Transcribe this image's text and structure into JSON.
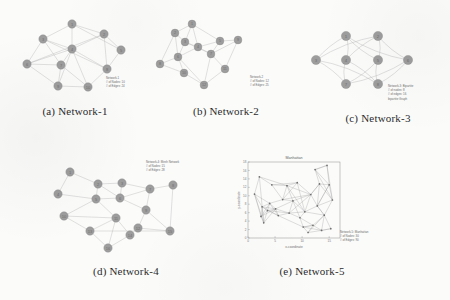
{
  "figure": {
    "panels": [
      {
        "key": "a",
        "caption": "(a) Network-1",
        "annotation": [
          "Network-1",
          "# of Nodes: 10",
          "# of Edges: 24"
        ],
        "node_label_prefix": "n",
        "nodes": [
          {
            "id": "1",
            "x": 72,
            "y": 22
          },
          {
            "id": "2",
            "x": 104,
            "y": 32
          },
          {
            "id": "3",
            "x": 43,
            "y": 37
          },
          {
            "id": "4",
            "x": 72,
            "y": 47
          },
          {
            "id": "5",
            "x": 121,
            "y": 48
          },
          {
            "id": "6",
            "x": 27,
            "y": 62
          },
          {
            "id": "7",
            "x": 61,
            "y": 63
          },
          {
            "id": "8",
            "x": 107,
            "y": 67
          },
          {
            "id": "9",
            "x": 58,
            "y": 84
          },
          {
            "id": "10",
            "x": 88,
            "y": 85
          }
        ],
        "edges": [
          [
            0,
            1
          ],
          [
            0,
            2
          ],
          [
            0,
            3
          ],
          [
            0,
            4
          ],
          [
            1,
            3
          ],
          [
            1,
            4
          ],
          [
            1,
            7
          ],
          [
            2,
            3
          ],
          [
            2,
            5
          ],
          [
            2,
            6
          ],
          [
            3,
            5
          ],
          [
            3,
            6
          ],
          [
            3,
            7
          ],
          [
            3,
            8
          ],
          [
            3,
            9
          ],
          [
            4,
            7
          ],
          [
            5,
            6
          ],
          [
            5,
            8
          ],
          [
            6,
            8
          ],
          [
            6,
            9
          ],
          [
            7,
            9
          ],
          [
            8,
            9
          ],
          [
            2,
            7
          ],
          [
            1,
            5
          ]
        ]
      },
      {
        "key": "b",
        "caption": "(b) Network-2",
        "annotation": [
          "Network-2",
          "# of Nodes: 12",
          "# of Edges: 25"
        ],
        "nodes": [
          {
            "id": "1",
            "x": 40,
            "y": 22
          },
          {
            "id": "2",
            "x": 23,
            "y": 31
          },
          {
            "id": "3",
            "x": 33,
            "y": 40
          },
          {
            "id": "4",
            "x": 46,
            "y": 45
          },
          {
            "id": "5",
            "x": 68,
            "y": 39
          },
          {
            "id": "6",
            "x": 26,
            "y": 55
          },
          {
            "id": "7",
            "x": 59,
            "y": 52
          },
          {
            "id": "8",
            "x": 8,
            "y": 62
          },
          {
            "id": "9",
            "x": 86,
            "y": 38
          },
          {
            "id": "10",
            "x": 32,
            "y": 71
          },
          {
            "id": "11",
            "x": 73,
            "y": 67
          },
          {
            "id": "12",
            "x": 52,
            "y": 83
          }
        ],
        "edges": [
          [
            0,
            2
          ],
          [
            0,
            3
          ],
          [
            0,
            1
          ],
          [
            1,
            2
          ],
          [
            1,
            5
          ],
          [
            2,
            3
          ],
          [
            2,
            5
          ],
          [
            3,
            4
          ],
          [
            3,
            6
          ],
          [
            4,
            6
          ],
          [
            4,
            8
          ],
          [
            5,
            7
          ],
          [
            5,
            9
          ],
          [
            6,
            10
          ],
          [
            6,
            11
          ],
          [
            7,
            9
          ],
          [
            8,
            10
          ],
          [
            9,
            11
          ],
          [
            10,
            11
          ],
          [
            2,
            6
          ],
          [
            3,
            5
          ],
          [
            5,
            11
          ],
          [
            0,
            4
          ],
          [
            6,
            8
          ],
          [
            1,
            7
          ]
        ]
      },
      {
        "key": "c",
        "caption": "(c) Network-3",
        "annotation": [
          "Network-3: Bipartite",
          "# of nodes: 8",
          "# of edges: 16",
          "bipartite Graph"
        ],
        "nodes": [
          {
            "id": "1",
            "x": 40,
            "y": 20
          },
          {
            "id": "2",
            "x": 72,
            "y": 20
          },
          {
            "id": "3",
            "x": 10,
            "y": 44
          },
          {
            "id": "4",
            "x": 40,
            "y": 44
          },
          {
            "id": "5",
            "x": 72,
            "y": 44
          },
          {
            "id": "6",
            "x": 102,
            "y": 44
          },
          {
            "id": "7",
            "x": 40,
            "y": 68
          },
          {
            "id": "8",
            "x": 72,
            "y": 68
          }
        ],
        "edges": [
          [
            0,
            2
          ],
          [
            0,
            3
          ],
          [
            0,
            4
          ],
          [
            0,
            5
          ],
          [
            1,
            2
          ],
          [
            1,
            3
          ],
          [
            1,
            4
          ],
          [
            1,
            5
          ],
          [
            6,
            2
          ],
          [
            6,
            3
          ],
          [
            6,
            4
          ],
          [
            6,
            5
          ],
          [
            7,
            2
          ],
          [
            7,
            3
          ],
          [
            7,
            4
          ],
          [
            7,
            5
          ]
        ],
        "curved": true
      },
      {
        "key": "d",
        "caption": "(d) Network-4",
        "annotation": [
          "Network-4: Mesh Network",
          "# of Nodes: 15",
          "# of Edges: 28"
        ],
        "nodes": [
          {
            "id": "1",
            "x": 24,
            "y": 14
          },
          {
            "id": "2",
            "x": 52,
            "y": 26
          },
          {
            "id": "3",
            "x": 76,
            "y": 25
          },
          {
            "id": "4",
            "x": 12,
            "y": 36
          },
          {
            "id": "5",
            "x": 50,
            "y": 41
          },
          {
            "id": "6",
            "x": 74,
            "y": 40
          },
          {
            "id": "7",
            "x": 104,
            "y": 31
          },
          {
            "id": "8",
            "x": 127,
            "y": 27
          },
          {
            "id": "9",
            "x": 100,
            "y": 52
          },
          {
            "id": "10",
            "x": 18,
            "y": 58
          },
          {
            "id": "11",
            "x": 70,
            "y": 60
          },
          {
            "id": "12",
            "x": 92,
            "y": 70
          },
          {
            "id": "13",
            "x": 44,
            "y": 73
          },
          {
            "id": "14",
            "x": 84,
            "y": 77
          },
          {
            "id": "15",
            "x": 124,
            "y": 73
          },
          {
            "id": "16",
            "x": 62,
            "y": 90
          }
        ],
        "edges": [
          [
            0,
            1
          ],
          [
            0,
            3
          ],
          [
            1,
            2
          ],
          [
            1,
            4
          ],
          [
            2,
            5
          ],
          [
            3,
            4
          ],
          [
            4,
            5
          ],
          [
            4,
            10
          ],
          [
            5,
            8
          ],
          [
            5,
            6
          ],
          [
            6,
            7
          ],
          [
            6,
            8
          ],
          [
            8,
            11
          ],
          [
            9,
            10
          ],
          [
            9,
            12
          ],
          [
            10,
            12
          ],
          [
            10,
            13
          ],
          [
            11,
            13
          ],
          [
            11,
            14
          ],
          [
            12,
            15
          ],
          [
            13,
            15
          ],
          [
            10,
            15
          ],
          [
            2,
            6
          ],
          [
            8,
            14
          ],
          [
            4,
            9
          ],
          [
            7,
            14
          ],
          [
            1,
            5
          ],
          [
            12,
            14
          ]
        ]
      },
      {
        "key": "e",
        "caption": "(e) Network-5",
        "annotation": [
          "Network-5: Manhattan",
          "# of Nodes: 30",
          "# of Edges: 90"
        ]
      }
    ]
  },
  "chart_data": {
    "type": "scatter",
    "title": "Manhattan",
    "xlabel": "x-coordinate",
    "ylabel": "y-coordinate",
    "xlim": [
      0,
      17
    ],
    "ylim": [
      0,
      18
    ],
    "xticks": [
      0,
      5,
      10,
      15
    ],
    "yticks": [
      0,
      2,
      4,
      6,
      8,
      10,
      12,
      14,
      16,
      18
    ],
    "grid": false,
    "legend": "none",
    "points": [
      {
        "x": 1.2,
        "y": 10.4
      },
      {
        "x": 2.1,
        "y": 14.5
      },
      {
        "x": 2.6,
        "y": 7.4
      },
      {
        "x": 2.4,
        "y": 5.1
      },
      {
        "x": 2.9,
        "y": 3.6
      },
      {
        "x": 3.6,
        "y": 6.5
      },
      {
        "x": 4.0,
        "y": 8.2
      },
      {
        "x": 4.4,
        "y": 12.6
      },
      {
        "x": 5.1,
        "y": 6.9
      },
      {
        "x": 5.6,
        "y": 5.3
      },
      {
        "x": 6.4,
        "y": 9.1
      },
      {
        "x": 7.2,
        "y": 12.4
      },
      {
        "x": 7.6,
        "y": 5.9
      },
      {
        "x": 8.3,
        "y": 8.8
      },
      {
        "x": 9.1,
        "y": 13.1
      },
      {
        "x": 9.6,
        "y": 4.8
      },
      {
        "x": 10.2,
        "y": 2.6
      },
      {
        "x": 10.5,
        "y": 6.2
      },
      {
        "x": 11.1,
        "y": 1.3
      },
      {
        "x": 11.6,
        "y": 10.3
      },
      {
        "x": 12.0,
        "y": 3.0
      },
      {
        "x": 12.4,
        "y": 16.2
      },
      {
        "x": 12.8,
        "y": 7.6
      },
      {
        "x": 13.2,
        "y": 12.8
      },
      {
        "x": 13.6,
        "y": 1.8
      },
      {
        "x": 14.1,
        "y": 5.4
      },
      {
        "x": 14.6,
        "y": 17.2
      },
      {
        "x": 15.0,
        "y": 12.6
      },
      {
        "x": 15.3,
        "y": 2.2
      },
      {
        "x": 15.6,
        "y": 9.0
      }
    ],
    "edges": [
      [
        0,
        1
      ],
      [
        0,
        2
      ],
      [
        0,
        3
      ],
      [
        0,
        6
      ],
      [
        1,
        7
      ],
      [
        1,
        11
      ],
      [
        2,
        3
      ],
      [
        2,
        4
      ],
      [
        2,
        5
      ],
      [
        2,
        6
      ],
      [
        2,
        8
      ],
      [
        3,
        4
      ],
      [
        3,
        5
      ],
      [
        3,
        8
      ],
      [
        4,
        5
      ],
      [
        5,
        6
      ],
      [
        5,
        8
      ],
      [
        5,
        9
      ],
      [
        6,
        8
      ],
      [
        6,
        10
      ],
      [
        7,
        11
      ],
      [
        7,
        10
      ],
      [
        8,
        9
      ],
      [
        8,
        12
      ],
      [
        9,
        12
      ],
      [
        10,
        13
      ],
      [
        10,
        19
      ],
      [
        11,
        14
      ],
      [
        11,
        19
      ],
      [
        12,
        13
      ],
      [
        12,
        15
      ],
      [
        13,
        17
      ],
      [
        13,
        19
      ],
      [
        14,
        19
      ],
      [
        15,
        16
      ],
      [
        15,
        17
      ],
      [
        16,
        18
      ],
      [
        16,
        20
      ],
      [
        17,
        19
      ],
      [
        17,
        22
      ],
      [
        18,
        20
      ],
      [
        18,
        24
      ],
      [
        20,
        24
      ],
      [
        21,
        23
      ],
      [
        21,
        26
      ],
      [
        22,
        23
      ],
      [
        22,
        25
      ],
      [
        23,
        27
      ],
      [
        24,
        28
      ],
      [
        25,
        28
      ],
      [
        25,
        22
      ],
      [
        26,
        27
      ],
      [
        27,
        29
      ],
      [
        22,
        29
      ],
      [
        19,
        23
      ],
      [
        9,
        16
      ],
      [
        4,
        8
      ],
      [
        1,
        4
      ],
      [
        3,
        6
      ],
      [
        11,
        13
      ],
      [
        14,
        17
      ],
      [
        16,
        24
      ],
      [
        20,
        25
      ],
      [
        23,
        29
      ],
      [
        26,
        21
      ],
      [
        12,
        17
      ],
      [
        6,
        9
      ],
      [
        10,
        14
      ],
      [
        0,
        4
      ],
      [
        5,
        12
      ],
      [
        8,
        13
      ],
      [
        13,
        15
      ],
      [
        15,
        20
      ],
      [
        17,
        25
      ],
      [
        19,
        22
      ],
      [
        21,
        27
      ],
      [
        24,
        25
      ],
      [
        27,
        22
      ],
      [
        29,
        25
      ],
      [
        2,
        9
      ],
      [
        7,
        14
      ],
      [
        11,
        17
      ],
      [
        18,
        25
      ],
      [
        28,
        24
      ],
      [
        23,
        19
      ],
      [
        16,
        20
      ],
      [
        26,
        29
      ],
      [
        21,
        29
      ],
      [
        22,
        27
      ],
      [
        12,
        19
      ],
      [
        10,
        11
      ]
    ]
  }
}
